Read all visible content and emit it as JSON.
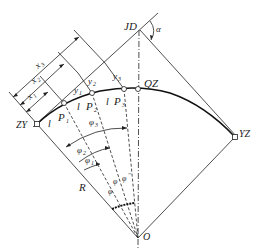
{
  "diagram": {
    "type": "circular-curve-layout",
    "points": {
      "ZY": "ZY",
      "QZ": "QZ",
      "YZ": "YZ",
      "JD": "JD",
      "O": "O",
      "P1": "P",
      "P2": "P",
      "P3": "P"
    },
    "subscripts": {
      "one": "1",
      "two": "2",
      "three": "3"
    },
    "labels": {
      "alpha": "α",
      "radius": "R",
      "arc_length": "l",
      "x": "x",
      "y": "y",
      "phi": "φ",
      "phi_sup": "\"",
      "phi_sup_prime": "φ"
    },
    "colors": {
      "stroke": "#222222",
      "background": "#ffffff"
    }
  }
}
